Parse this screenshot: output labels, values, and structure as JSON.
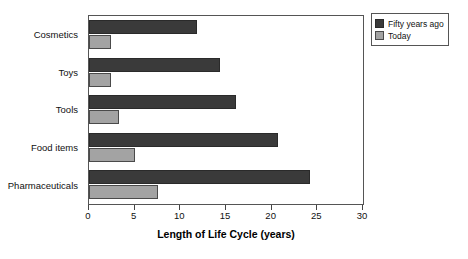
{
  "chart_data": {
    "type": "bar",
    "orientation": "horizontal",
    "title": "",
    "xlabel": "Length of Life Cycle (years)",
    "ylabel": "",
    "xlim": [
      0,
      30
    ],
    "xticks": [
      0,
      5,
      10,
      15,
      20,
      25,
      30
    ],
    "xtick_labels": [
      "0",
      "5",
      "10",
      "15",
      "20",
      "25",
      "30"
    ],
    "grid": false,
    "legend_position": "top-right",
    "categories": [
      "Cosmetics",
      "Toys",
      "Tools",
      "Food items",
      "Pharmaceuticals"
    ],
    "series": [
      {
        "name": "Fifty years ago",
        "color": "#3a3a3a",
        "values": [
          11.8,
          14.3,
          16.1,
          20.7,
          24.2
        ]
      },
      {
        "name": "Today",
        "color": "#a3a3a3",
        "values": [
          2.4,
          2.4,
          3.3,
          5.0,
          7.5
        ]
      }
    ]
  }
}
